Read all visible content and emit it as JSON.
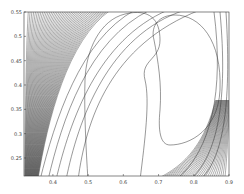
{
  "chart_data": {
    "type": "contour",
    "title": "",
    "xlabel": "",
    "ylabel": "",
    "xlim": [
      0.318,
      0.9
    ],
    "ylim": [
      0.213,
      0.55
    ],
    "grid": false,
    "legend": null,
    "x_ticks": [
      "0.4",
      "0.5",
      "0.6",
      "0.7",
      "0.8",
      "0.9"
    ],
    "y_ticks": [
      "0.25",
      "0.3",
      "0.35",
      "0.4",
      "0.45",
      "0.5",
      "0.55"
    ],
    "x_tick_values": [
      0.4,
      0.5,
      0.6,
      0.7,
      0.8,
      0.9
    ],
    "y_tick_values": [
      0.25,
      0.3,
      0.35,
      0.4,
      0.45,
      0.5,
      0.55
    ],
    "line_color": "#333333",
    "innermost_regions": [
      {
        "name": "left-lobe",
        "x_center": 0.56,
        "y_range": [
          0.213,
          0.53
        ]
      },
      {
        "name": "right-crescent",
        "x_center": 0.77,
        "y_range": [
          0.29,
          0.53
        ]
      }
    ]
  }
}
